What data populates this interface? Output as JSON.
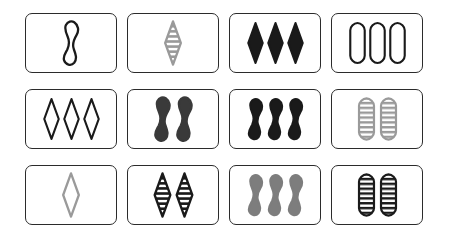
{
  "board": {
    "title": "SET card game board",
    "layout": {
      "rows": 3,
      "columns": 4,
      "card_count": 12
    },
    "background_color": "#ffffff",
    "card_border_color": "#2b2b2b",
    "palette": {
      "black": "#1a1a1a",
      "dark_gray": "#3a3a3a",
      "medium_gray": "#7d7d7d",
      "light_gray": "#9a9a9a"
    },
    "cards": [
      {
        "position": "row1-col1",
        "count": 1,
        "shape": "squiggle",
        "shading": "open",
        "color_name": "black",
        "color": "#1a1a1a",
        "label": "one open black squiggle"
      },
      {
        "position": "row1-col2",
        "count": 1,
        "shape": "diamond",
        "shading": "striped",
        "color_name": "gray",
        "color": "#9a9a9a",
        "label": "one striped gray diamond"
      },
      {
        "position": "row1-col3",
        "count": 3,
        "shape": "diamond",
        "shading": "solid",
        "color_name": "black",
        "color": "#1a1a1a",
        "label": "three solid black diamonds"
      },
      {
        "position": "row1-col4",
        "count": 3,
        "shape": "pill",
        "shading": "open",
        "color_name": "black",
        "color": "#1a1a1a",
        "label": "three open black pills"
      },
      {
        "position": "row2-col1",
        "count": 3,
        "shape": "diamond",
        "shading": "open",
        "color_name": "black",
        "color": "#1a1a1a",
        "label": "three open black diamonds"
      },
      {
        "position": "row2-col2",
        "count": 2,
        "shape": "squiggle",
        "shading": "solid",
        "color_name": "dark gray",
        "color": "#3a3a3a",
        "label": "two solid dark gray squiggles"
      },
      {
        "position": "row2-col3",
        "count": 3,
        "shape": "squiggle",
        "shading": "solid",
        "color_name": "black",
        "color": "#1a1a1a",
        "label": "three solid black squiggles"
      },
      {
        "position": "row2-col4",
        "count": 2,
        "shape": "pill",
        "shading": "striped",
        "color_name": "gray",
        "color": "#9a9a9a",
        "label": "two striped gray pills"
      },
      {
        "position": "row3-col1",
        "count": 1,
        "shape": "diamond",
        "shading": "open",
        "color_name": "gray",
        "color": "#9a9a9a",
        "label": "one open gray diamond"
      },
      {
        "position": "row3-col2",
        "count": 2,
        "shape": "diamond",
        "shading": "striped",
        "color_name": "black",
        "color": "#1a1a1a",
        "label": "two striped black diamonds"
      },
      {
        "position": "row3-col3",
        "count": 3,
        "shape": "squiggle",
        "shading": "solid",
        "color_name": "medium gray",
        "color": "#7d7d7d",
        "label": "three solid medium gray squiggles"
      },
      {
        "position": "row3-col4",
        "count": 2,
        "shape": "pill",
        "shading": "striped",
        "color_name": "black",
        "color": "#1a1a1a",
        "label": "two striped black pills"
      }
    ]
  }
}
